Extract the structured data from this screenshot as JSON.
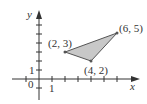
{
  "diagram": {
    "type": "coordinate-plane-triangle",
    "axes": {
      "x_label": "x",
      "y_label": "y",
      "origin_label": "0",
      "x_tick_label": "1",
      "y_tick_label": "1"
    },
    "vertices": [
      {
        "label": "(2, 3)",
        "x": 2,
        "y": 3
      },
      {
        "label": "(4, 2)",
        "x": 4,
        "y": 2
      },
      {
        "label": "(6, 5)",
        "x": 6,
        "y": 5
      }
    ],
    "colors": {
      "fill": "#c8c8c8",
      "stroke": "#555555",
      "axis": "#333333"
    }
  }
}
